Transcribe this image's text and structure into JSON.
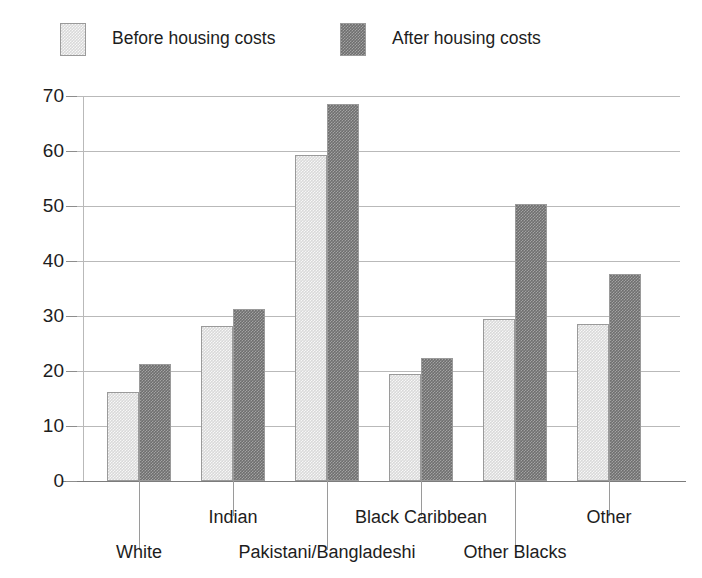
{
  "legend": {
    "position": "top",
    "entries": [
      {
        "label": "Before housing costs",
        "swatch": "light-gray-swatch",
        "color": "#d9d9d9"
      },
      {
        "label": "After housing costs",
        "swatch": "dark-gray-swatch",
        "color": "#6f6f6f"
      }
    ]
  },
  "axes": {
    "y_ticks": [
      "70",
      "60",
      "50",
      "40",
      "30",
      "20",
      "10",
      "0"
    ]
  },
  "chart_data": {
    "type": "bar",
    "title": "",
    "subtitle": "",
    "xlabel": "",
    "ylabel": "",
    "ylim": [
      0,
      70
    ],
    "ytick_step": 10,
    "grid": true,
    "legend_position": "top",
    "categories": [
      "White",
      "Indian",
      "Pakistani/Bangladeshi",
      "Black Caribbean",
      "Other Blacks",
      "Other"
    ],
    "series": [
      {
        "name": "Before housing costs",
        "color": "#d9d9d9",
        "values": [
          16.1,
          28.2,
          59.3,
          19.4,
          29.5,
          28.6
        ]
      },
      {
        "name": "After housing costs",
        "color": "#6f6f6f",
        "values": [
          21.2,
          31.3,
          68.5,
          22.3,
          50.4,
          37.6
        ]
      }
    ]
  }
}
